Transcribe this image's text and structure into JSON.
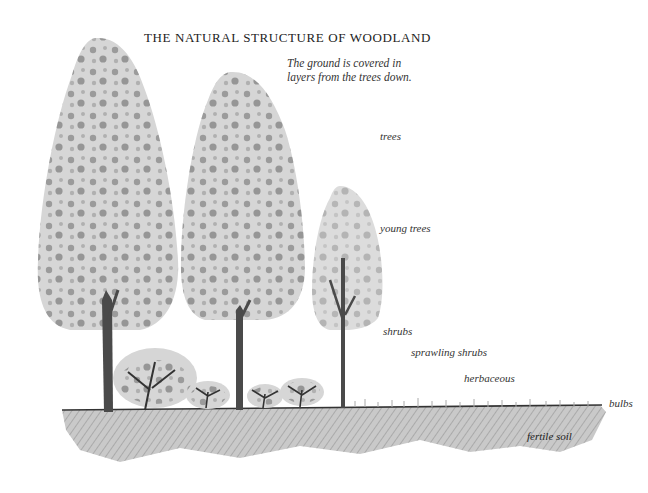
{
  "title": "THE NATURAL STRUCTURE OF WOODLAND",
  "caption": "The ground is covered in layers from the trees down.",
  "layers": [
    {
      "id": "trees",
      "label": "trees"
    },
    {
      "id": "young-trees",
      "label": "young trees"
    },
    {
      "id": "shrubs",
      "label": "shrubs"
    },
    {
      "id": "sprawling-shrubs",
      "label": "sprawling shrubs"
    },
    {
      "id": "herbaceous",
      "label": "herbaceous"
    },
    {
      "id": "bulbs",
      "label": "bulbs"
    },
    {
      "id": "fertile-soil",
      "label": "fertile soil"
    }
  ],
  "colors": {
    "canopy": "#d6d6d6",
    "foliage": "#5a5a5a",
    "trunk": "#4a4a4a",
    "soil": "#9a9a9a"
  }
}
